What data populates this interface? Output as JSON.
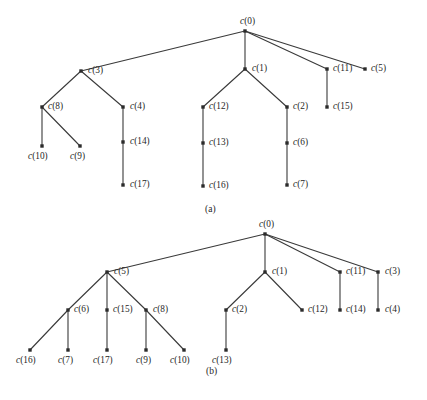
{
  "figure": {
    "background_color": "#ffffff",
    "edge_color": "#3a3a3a",
    "node_color": "#2b2b2b",
    "text_color": "#262626",
    "width": 427,
    "height": 400
  },
  "captions": [
    {
      "text": "(a)",
      "x": 205,
      "y": 205
    },
    {
      "text": "(b)",
      "x": 206,
      "y": 367
    }
  ],
  "panels": [
    {
      "id": "panel-a",
      "caption": "(a)",
      "root": "c(0)",
      "nodes": [
        {
          "id": "c0",
          "label": "c(0)",
          "x": 245,
          "y": 31,
          "lx": 240,
          "ly": 17,
          "anchor": "above"
        },
        {
          "id": "c3",
          "label": "c(3)",
          "x": 81,
          "y": 71,
          "lx": 88,
          "ly": 66,
          "anchor": "right"
        },
        {
          "id": "c1",
          "label": "c(1)",
          "x": 245,
          "y": 69,
          "lx": 252,
          "ly": 64,
          "anchor": "right"
        },
        {
          "id": "c11",
          "label": "c(11)",
          "x": 327,
          "y": 69,
          "lx": 333,
          "ly": 64,
          "anchor": "right"
        },
        {
          "id": "c5",
          "label": "c(5)",
          "x": 365,
          "y": 69,
          "lx": 371,
          "ly": 64,
          "anchor": "right"
        },
        {
          "id": "c8",
          "label": "c(8)",
          "x": 42,
          "y": 107,
          "lx": 48,
          "ly": 102,
          "anchor": "right"
        },
        {
          "id": "c4",
          "label": "c(4)",
          "x": 123,
          "y": 107,
          "lx": 130,
          "ly": 102,
          "anchor": "right"
        },
        {
          "id": "c12",
          "label": "c(12)",
          "x": 203,
          "y": 107,
          "lx": 209,
          "ly": 102,
          "anchor": "right"
        },
        {
          "id": "c2",
          "label": "c(2)",
          "x": 287,
          "y": 107,
          "lx": 293,
          "ly": 102,
          "anchor": "right"
        },
        {
          "id": "c15",
          "label": "c(15)",
          "x": 327,
          "y": 107,
          "lx": 333,
          "ly": 102,
          "anchor": "right"
        },
        {
          "id": "c10",
          "label": "c(10)",
          "x": 42,
          "y": 146,
          "lx": 28,
          "ly": 152,
          "anchor": "below"
        },
        {
          "id": "c9",
          "label": "c(9)",
          "x": 80,
          "y": 146,
          "lx": 70,
          "ly": 152,
          "anchor": "below"
        },
        {
          "id": "c14",
          "label": "c(14)",
          "x": 123,
          "y": 142,
          "lx": 130,
          "ly": 137,
          "anchor": "right"
        },
        {
          "id": "c13",
          "label": "c(13)",
          "x": 203,
          "y": 143,
          "lx": 209,
          "ly": 138,
          "anchor": "right"
        },
        {
          "id": "c6",
          "label": "c(6)",
          "x": 287,
          "y": 143,
          "lx": 293,
          "ly": 138,
          "anchor": "right"
        },
        {
          "id": "c17",
          "label": "c(17)",
          "x": 123,
          "y": 185,
          "lx": 130,
          "ly": 180,
          "anchor": "right"
        },
        {
          "id": "c16",
          "label": "c(16)",
          "x": 203,
          "y": 186,
          "lx": 209,
          "ly": 181,
          "anchor": "right"
        },
        {
          "id": "c7",
          "label": "c(7)",
          "x": 287,
          "y": 185,
          "lx": 293,
          "ly": 180,
          "anchor": "right"
        }
      ],
      "edges": [
        {
          "from": "c0",
          "to": "c3"
        },
        {
          "from": "c0",
          "to": "c1"
        },
        {
          "from": "c0",
          "to": "c11"
        },
        {
          "from": "c0",
          "to": "c5"
        },
        {
          "from": "c3",
          "to": "c8"
        },
        {
          "from": "c3",
          "to": "c4"
        },
        {
          "from": "c8",
          "to": "c10"
        },
        {
          "from": "c8",
          "to": "c9"
        },
        {
          "from": "c4",
          "to": "c14"
        },
        {
          "from": "c14",
          "to": "c17"
        },
        {
          "from": "c1",
          "to": "c12"
        },
        {
          "from": "c1",
          "to": "c2"
        },
        {
          "from": "c12",
          "to": "c13"
        },
        {
          "from": "c13",
          "to": "c16"
        },
        {
          "from": "c2",
          "to": "c6"
        },
        {
          "from": "c6",
          "to": "c7"
        },
        {
          "from": "c11",
          "to": "c15"
        }
      ]
    },
    {
      "id": "panel-b",
      "caption": "(b)",
      "root": "c(0)",
      "nodes": [
        {
          "id": "c0",
          "label": "c(0)",
          "x": 265,
          "y": 234,
          "lx": 259,
          "ly": 220,
          "anchor": "above"
        },
        {
          "id": "c5",
          "label": "c(5)",
          "x": 107,
          "y": 272,
          "lx": 114,
          "ly": 267,
          "anchor": "right"
        },
        {
          "id": "c1",
          "label": "c(1)",
          "x": 265,
          "y": 272,
          "lx": 272,
          "ly": 267,
          "anchor": "right"
        },
        {
          "id": "c11",
          "label": "c(11)",
          "x": 340,
          "y": 272,
          "lx": 346,
          "ly": 267,
          "anchor": "right"
        },
        {
          "id": "c3",
          "label": "c(3)",
          "x": 378,
          "y": 272,
          "lx": 385,
          "ly": 267,
          "anchor": "right"
        },
        {
          "id": "c6",
          "label": "c(6)",
          "x": 68,
          "y": 310,
          "lx": 74,
          "ly": 305,
          "anchor": "right"
        },
        {
          "id": "c15",
          "label": "c(15)",
          "x": 107,
          "y": 310,
          "lx": 113,
          "ly": 305,
          "anchor": "right"
        },
        {
          "id": "c8",
          "label": "c(8)",
          "x": 146,
          "y": 310,
          "lx": 153,
          "ly": 305,
          "anchor": "right"
        },
        {
          "id": "c2",
          "label": "c(2)",
          "x": 226,
          "y": 310,
          "lx": 232,
          "ly": 305,
          "anchor": "right"
        },
        {
          "id": "c12",
          "label": "c(12)",
          "x": 302,
          "y": 310,
          "lx": 308,
          "ly": 305,
          "anchor": "right"
        },
        {
          "id": "c14",
          "label": "c(14)",
          "x": 340,
          "y": 310,
          "lx": 346,
          "ly": 305,
          "anchor": "right"
        },
        {
          "id": "c4",
          "label": "c(4)",
          "x": 378,
          "y": 310,
          "lx": 385,
          "ly": 305,
          "anchor": "right"
        },
        {
          "id": "c16",
          "label": "c(16)",
          "x": 30,
          "y": 350,
          "lx": 16,
          "ly": 356,
          "anchor": "below"
        },
        {
          "id": "c7",
          "label": "c(7)",
          "x": 68,
          "y": 350,
          "lx": 58,
          "ly": 356,
          "anchor": "below"
        },
        {
          "id": "c17",
          "label": "c(17)",
          "x": 107,
          "y": 350,
          "lx": 93,
          "ly": 356,
          "anchor": "below"
        },
        {
          "id": "c9",
          "label": "c(9)",
          "x": 146,
          "y": 350,
          "lx": 136,
          "ly": 356,
          "anchor": "below"
        },
        {
          "id": "c10",
          "label": "c(10)",
          "x": 184,
          "y": 350,
          "lx": 170,
          "ly": 356,
          "anchor": "below"
        },
        {
          "id": "c13",
          "label": "c(13)",
          "x": 226,
          "y": 350,
          "lx": 212,
          "ly": 356,
          "anchor": "below"
        }
      ],
      "edges": [
        {
          "from": "c0",
          "to": "c5"
        },
        {
          "from": "c0",
          "to": "c1"
        },
        {
          "from": "c0",
          "to": "c11"
        },
        {
          "from": "c0",
          "to": "c3"
        },
        {
          "from": "c5",
          "to": "c6"
        },
        {
          "from": "c5",
          "to": "c15"
        },
        {
          "from": "c5",
          "to": "c8"
        },
        {
          "from": "c6",
          "to": "c16"
        },
        {
          "from": "c6",
          "to": "c7"
        },
        {
          "from": "c15",
          "to": "c17"
        },
        {
          "from": "c8",
          "to": "c9"
        },
        {
          "from": "c8",
          "to": "c10"
        },
        {
          "from": "c1",
          "to": "c2"
        },
        {
          "from": "c1",
          "to": "c12"
        },
        {
          "from": "c2",
          "to": "c13"
        },
        {
          "from": "c11",
          "to": "c14"
        },
        {
          "from": "c3",
          "to": "c4"
        }
      ]
    }
  ]
}
